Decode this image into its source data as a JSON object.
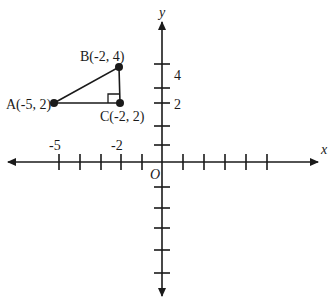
{
  "diagram": {
    "type": "coordinate-plane",
    "axes": {
      "x_label": "x",
      "y_label": "y",
      "origin_label": "O",
      "x_tick_labels": [
        {
          "value": -5,
          "text": "-5"
        },
        {
          "value": -2,
          "text": "-2"
        }
      ],
      "y_tick_labels": [
        {
          "value": 4,
          "text": "4"
        },
        {
          "value": 2,
          "text": "2"
        }
      ],
      "x_ticks": [
        -5,
        -4,
        -3,
        -2,
        -1,
        1,
        2,
        3,
        4,
        5
      ],
      "y_ticks": [
        5,
        4,
        3,
        2,
        1,
        -1,
        -2,
        -3,
        -4,
        -5
      ]
    },
    "points": [
      {
        "id": "A",
        "label": "A(-5, 2)",
        "x": -5,
        "y": 2
      },
      {
        "id": "B",
        "label": "B(-2, 4)",
        "x": -2,
        "y": 4
      },
      {
        "id": "C",
        "label": "C(-2, 2)",
        "x": -2,
        "y": 2
      }
    ],
    "shapes": [
      {
        "type": "triangle",
        "vertices": [
          "A",
          "B",
          "C"
        ],
        "right_angle_at": "C"
      }
    ],
    "colors": {
      "stroke": "#1a1a1a",
      "background": "#ffffff"
    }
  }
}
